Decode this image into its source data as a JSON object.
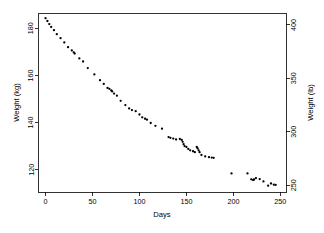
{
  "chart_data": {
    "type": "scatter",
    "title": "",
    "xlabel": "Days",
    "ylabel": "Weight (kg)",
    "y2label": "Weight (lb)",
    "xlim": [
      -8,
      256
    ],
    "ylim": [
      110.5,
      186.5
    ],
    "y2lim": [
      243.6,
      411.2
    ],
    "grid": false,
    "legend": null,
    "marker": "filled-circle",
    "marker_color": "#000000",
    "xticks": [
      0,
      50,
      100,
      150,
      200,
      250
    ],
    "xticklabels": [
      "0",
      "50",
      "100",
      "150",
      "200",
      "250"
    ],
    "yticks": [
      120,
      140,
      160,
      180
    ],
    "yticklabels": [
      "120",
      "140",
      "160",
      "180"
    ],
    "y2ticks": [
      250,
      300,
      350,
      400
    ],
    "y2ticklabels": [
      "250",
      "300",
      "350",
      "400"
    ],
    "x": [
      0,
      2,
      4,
      6,
      9,
      12,
      16,
      20,
      24,
      28,
      30,
      31,
      36,
      40,
      45,
      52,
      58,
      62,
      66,
      68,
      70,
      71,
      73,
      76,
      80,
      85,
      89,
      92,
      96,
      100,
      103,
      106,
      108,
      112,
      117,
      124,
      131,
      133,
      136,
      139,
      143,
      145,
      146,
      147,
      148,
      150,
      152,
      154,
      157,
      159,
      161,
      162,
      163,
      164,
      166,
      170,
      174,
      177,
      179,
      198,
      215,
      219,
      221,
      222,
      224,
      228,
      232,
      237,
      240,
      243,
      245
    ],
    "y": [
      184.3,
      183.1,
      181.8,
      180.6,
      179.2,
      177.5,
      175.8,
      174.0,
      172.0,
      170.6,
      169.8,
      169.3,
      167.2,
      165.9,
      163.1,
      160.4,
      158.0,
      156.4,
      154.7,
      154.3,
      153.6,
      153.2,
      152.3,
      151.4,
      149.2,
      147.4,
      146.0,
      145.3,
      144.8,
      143.4,
      142.2,
      141.6,
      141.2,
      139.8,
      138.6,
      137.4,
      133.8,
      133.5,
      133.2,
      132.8,
      133.0,
      132.6,
      131.8,
      130.8,
      130.0,
      129.6,
      128.8,
      128.2,
      127.8,
      127.4,
      129.6,
      129.0,
      128.2,
      127.4,
      126.2,
      125.6,
      125.3,
      125.1,
      125.0,
      118.4,
      118.4,
      115.9,
      115.6,
      115.8,
      116.4,
      116.0,
      115.0,
      113.2,
      114.1,
      113.6,
      113.5
    ]
  },
  "plot": {
    "frame": {
      "left": 38,
      "top": 13,
      "right": 286,
      "bottom": 192
    }
  }
}
